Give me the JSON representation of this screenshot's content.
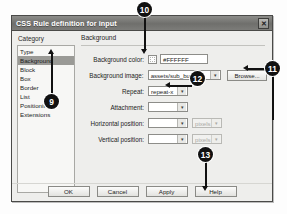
{
  "dialog": {
    "title": "CSS Rule definition for input",
    "close_label": "✕"
  },
  "sidebar": {
    "header": "Category",
    "items": [
      {
        "label": "Type",
        "selected": false
      },
      {
        "label": "Background",
        "selected": true
      },
      {
        "label": "Block",
        "selected": false
      },
      {
        "label": "Box",
        "selected": false
      },
      {
        "label": "Border",
        "selected": false
      },
      {
        "label": "List",
        "selected": false
      },
      {
        "label": "Positioning",
        "selected": false
      },
      {
        "label": "Extensions",
        "selected": false
      }
    ]
  },
  "panel": {
    "heading": "Background",
    "fields": {
      "background_color": {
        "label": "Background color:",
        "value": "#FFFFFF",
        "swatch_color": "#FFFFFF"
      },
      "background_image": {
        "label": "Background image:",
        "value": "assets/sub_butt.jpg",
        "browse_label": "Browse..."
      },
      "repeat": {
        "label": "Repeat:",
        "value": "repeat-x"
      },
      "attachment": {
        "label": "Attachment:",
        "value": ""
      },
      "horizontal_position": {
        "label": "Horizontal position:",
        "value": "",
        "unit_value": "pixels"
      },
      "vertical_position": {
        "label": "Vertical position:",
        "value": "",
        "unit_value": "pixels"
      }
    },
    "dropdown_arrow": "▾"
  },
  "footer": {
    "buttons": [
      {
        "label": "OK"
      },
      {
        "label": "Cancel"
      },
      {
        "label": "Apply"
      },
      {
        "label": "Help"
      }
    ]
  },
  "annotations": {
    "markers": [
      {
        "number": "9",
        "target": "category-background"
      },
      {
        "number": "10",
        "target": "background-color-field"
      },
      {
        "number": "11",
        "target": "browse-button"
      },
      {
        "number": "12",
        "target": "repeat-dropdown"
      },
      {
        "number": "13",
        "target": "apply-button"
      }
    ]
  }
}
